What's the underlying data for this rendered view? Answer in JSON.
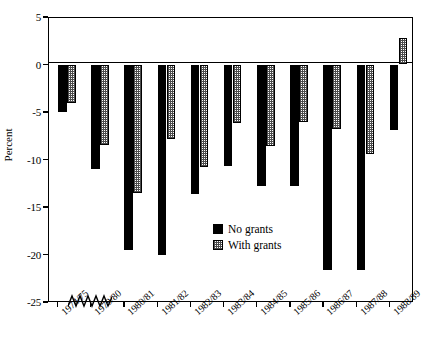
{
  "chart_data": {
    "type": "bar",
    "title": "",
    "xlabel": "",
    "ylabel": "Percent",
    "ylim": [
      -25,
      5
    ],
    "yticks": [
      5,
      0,
      -5,
      -10,
      -15,
      -20,
      -25
    ],
    "ytick_labels": [
      "5",
      "0",
      "-5",
      "-10",
      "-15",
      "-20",
      "-25"
    ],
    "grid": false,
    "axis_break_after_category": "1974/75",
    "legend_position": "center",
    "categories": [
      "1974/75",
      "1979/80",
      "1980/81",
      "1981/82",
      "1982/83",
      "1983/84",
      "1984/85",
      "1985/86",
      "1986/87",
      "1987/88",
      "1988/89"
    ],
    "series": [
      {
        "name": "No grants",
        "style": "solid-black",
        "color": "#000000",
        "values": [
          -5.0,
          -11.0,
          -19.5,
          -20.0,
          -13.6,
          -10.7,
          -12.8,
          -12.8,
          -21.6,
          -21.6,
          -6.9
        ]
      },
      {
        "name": "With grants",
        "style": "hatched-gray",
        "color": "#808080",
        "values": [
          -4.0,
          -8.5,
          -13.5,
          -7.8,
          -10.8,
          -6.2,
          -8.6,
          -6.1,
          -6.8,
          -9.4,
          2.8
        ]
      }
    ]
  },
  "legend": {
    "entries": [
      {
        "label": "No grants"
      },
      {
        "label": "With grants"
      }
    ]
  }
}
